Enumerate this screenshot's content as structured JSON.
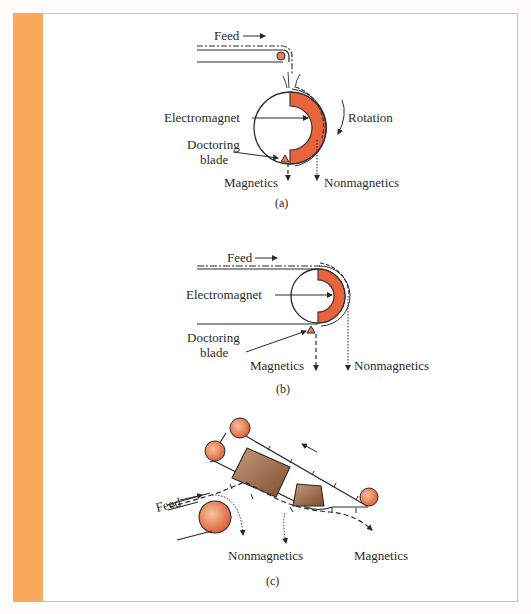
{
  "colors": {
    "frame_accent": "#f9a95c",
    "frame_border": "#f5b97a",
    "magnet_fill": "#e8643c",
    "roller_fill": "#e8825a",
    "box_fill": "#9a6a4a",
    "line": "#2a2a2a"
  },
  "panel_a": {
    "feed_label": "Feed",
    "electromagnet_label": "Electromagnet",
    "rotation_label": "Rotation",
    "doctoring_label_line1": "Doctoring",
    "doctoring_label_line2": "blade",
    "magnetics_label": "Magnetics",
    "nonmagnetics_label": "Nonmagnetics",
    "caption": "(a)"
  },
  "panel_b": {
    "feed_label": "Feed",
    "electromagnet_label": "Electromagnet",
    "doctoring_label_line1": "Doctoring",
    "doctoring_label_line2": "blade",
    "magnetics_label": "Magnetics",
    "nonmagnetics_label": "Nonmagnetics",
    "caption": "(b)"
  },
  "panel_c": {
    "feed_label": "Feed",
    "nonmagnetics_label": "Nonmagnetics",
    "magnetics_label": "Magnetics",
    "caption": "(c)"
  }
}
